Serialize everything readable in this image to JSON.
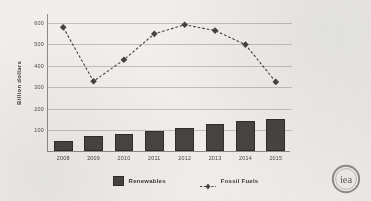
{
  "chart_data": {
    "type": "bar",
    "title": "",
    "xlabel": "",
    "ylabel": "Billion dollars",
    "ylim": [
      0,
      640
    ],
    "yticks": [
      100,
      200,
      300,
      400,
      500,
      600
    ],
    "ytick_labels": [
      "100",
      "200",
      "300",
      "400",
      "500",
      "600"
    ],
    "grid": true,
    "legend_position": "bottom",
    "categories": [
      "2008",
      "2009",
      "2010",
      "2011",
      "2012",
      "2013",
      "2014",
      "2015"
    ],
    "series": [
      {
        "name": "Renewables",
        "type": "bar",
        "color": "#474542",
        "values": [
          48,
          68,
          77,
          94,
          107,
          123,
          140,
          148
        ]
      },
      {
        "name": "Fossil Fuels",
        "type": "line",
        "color": "#45423f",
        "linestyle": "dashed",
        "marker": "diamond",
        "values": [
          578,
          328,
          428,
          548,
          590,
          563,
          498,
          325
        ]
      }
    ]
  },
  "legend": {
    "items": [
      {
        "label": "Renewables",
        "marker": "bar-swatch-icon"
      },
      {
        "label": "Fossil Fuels",
        "marker": "dashed-line-diamond-icon"
      }
    ]
  },
  "logo": {
    "text": "iea",
    "name": "iea-logo"
  }
}
